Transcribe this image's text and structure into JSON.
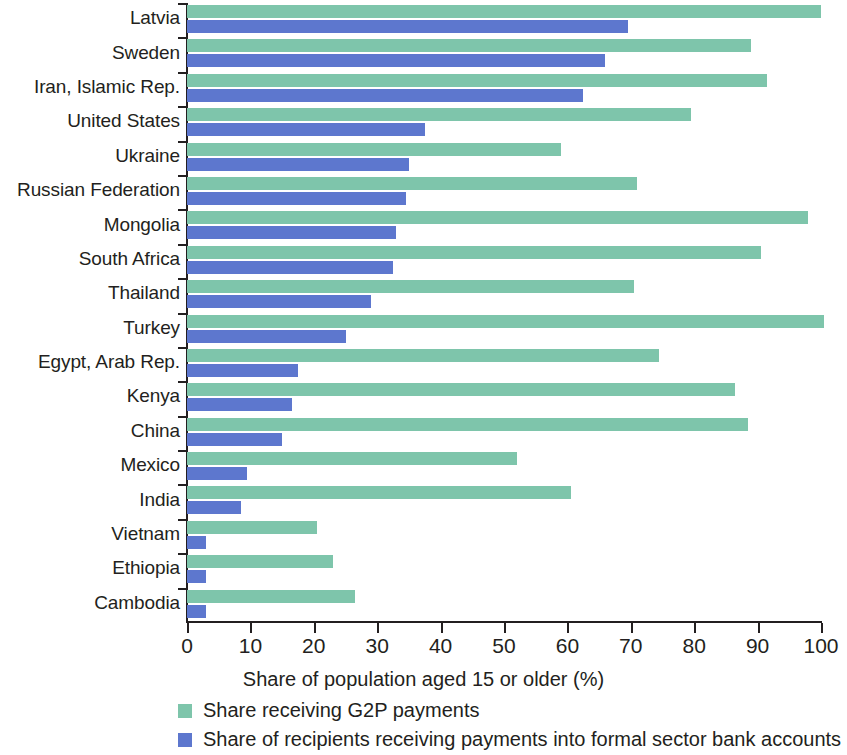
{
  "chart_data": {
    "type": "bar",
    "orientation": "horizontal",
    "title": "",
    "xlabel": "Share of population aged 15 or older (%)",
    "ylabel": "",
    "xlim": [
      0,
      100
    ],
    "xticks": [
      0,
      10,
      20,
      30,
      40,
      50,
      60,
      70,
      80,
      90,
      100
    ],
    "xticklabels": [
      "0",
      "10",
      "20",
      "30",
      "40",
      "50",
      "60",
      "70",
      "80",
      "90",
      "100"
    ],
    "grid": false,
    "legend_position": "bottom-left",
    "categories": [
      "Latvia",
      "Sweden",
      "Iran, Islamic Rep.",
      "United States",
      "Ukraine",
      "Russian Federation",
      "Mongolia",
      "South Africa",
      "Thailand",
      "Turkey",
      "Egypt, Arab Rep.",
      "Kenya",
      "China",
      "Mexico",
      "India",
      "Vietnam",
      "Ethiopia",
      "Cambodia"
    ],
    "series": [
      {
        "name": "Share receiving G2P payments",
        "color": "#7ec5ab",
        "values": [
          100,
          89,
          91.5,
          79.5,
          59,
          71,
          98,
          90.5,
          70.5,
          100.5,
          74.5,
          86.5,
          88.5,
          52,
          60.5,
          20.5,
          23,
          26.5
        ]
      },
      {
        "name": "Share of recipients receiving payments into formal sector bank accounts",
        "color": "#5d77ce",
        "values": [
          69.5,
          66,
          62.5,
          37.5,
          35,
          34.5,
          33,
          32.5,
          29,
          25,
          17.5,
          16.5,
          15,
          9.5,
          8.5,
          3,
          3,
          3
        ]
      }
    ]
  },
  "legend": {
    "items": [
      {
        "label": "Share receiving G2P payments",
        "color": "#7ec5ab"
      },
      {
        "label": "Share of recipients receiving payments into formal sector bank accounts",
        "color": "#5d77ce"
      }
    ]
  }
}
